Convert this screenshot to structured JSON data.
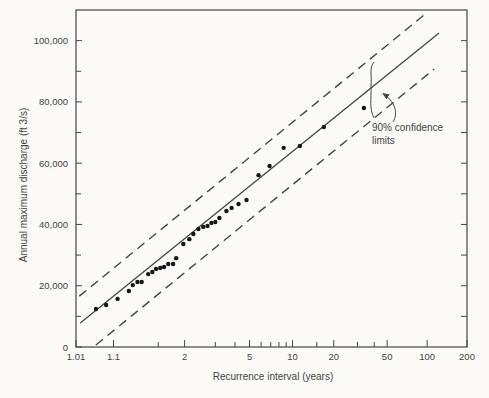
{
  "style": {
    "ink": "#454545",
    "paper": "#fbfaf7",
    "dot": "#161616"
  },
  "chart_data": {
    "type": "scatter",
    "title": "",
    "xlabel": "Recurrence interval (years)",
    "ylabel": "Annual maximum discharge (ft 3/s)",
    "x_scale": "gumbel-probability",
    "xlim": [
      1.01,
      200
    ],
    "ylim": [
      0,
      110000
    ],
    "grid": "off",
    "x_labeled_ticks": [
      "1.01",
      "1.1",
      "2",
      "5",
      "10",
      "20",
      "50",
      "100",
      "200"
    ],
    "x_minor_ticks": [
      1.5,
      3,
      4,
      6,
      7,
      8,
      9,
      15,
      30,
      40
    ],
    "y_labeled_ticks": [
      0,
      20000,
      40000,
      60000,
      80000,
      100000
    ],
    "y_minor_ticks": [
      10000,
      30000,
      50000,
      70000,
      90000
    ],
    "y_right_ticks": [
      10000,
      20000,
      30000,
      40000,
      50000,
      60000,
      70000,
      80000,
      90000,
      100000
    ],
    "points": [
      [
        1.04,
        12400
      ],
      [
        1.07,
        13700
      ],
      [
        1.12,
        15700
      ],
      [
        1.19,
        18300
      ],
      [
        1.22,
        20200
      ],
      [
        1.26,
        21200
      ],
      [
        1.3,
        21200
      ],
      [
        1.37,
        23800
      ],
      [
        1.42,
        24500
      ],
      [
        1.47,
        25500
      ],
      [
        1.53,
        25800
      ],
      [
        1.59,
        26100
      ],
      [
        1.66,
        27100
      ],
      [
        1.75,
        27100
      ],
      [
        1.81,
        29000
      ],
      [
        1.97,
        33600
      ],
      [
        2.12,
        35200
      ],
      [
        2.23,
        36900
      ],
      [
        2.38,
        38500
      ],
      [
        2.54,
        39200
      ],
      [
        2.69,
        39500
      ],
      [
        2.84,
        40500
      ],
      [
        3.0,
        40800
      ],
      [
        3.18,
        42100
      ],
      [
        3.52,
        44400
      ],
      [
        3.8,
        45400
      ],
      [
        4.22,
        46700
      ],
      [
        4.77,
        48000
      ],
      [
        5.76,
        56100
      ],
      [
        6.87,
        59100
      ],
      [
        8.64,
        65000
      ],
      [
        11.3,
        65600
      ],
      [
        16.9,
        71800
      ],
      [
        33.5,
        78000
      ]
    ],
    "fitted_line": [
      [
        1.014,
        7800
      ],
      [
        123,
        102500
      ]
    ],
    "upper_confidence_limit": [
      [
        1.013,
        16600
      ],
      [
        95,
        108400
      ]
    ],
    "lower_confidence_limit": [
      [
        1.04,
        650
      ],
      [
        113,
        90700
      ]
    ],
    "annotation": {
      "text": "90% confidence limits",
      "line1": "90% confidence",
      "line2": "limits"
    }
  }
}
